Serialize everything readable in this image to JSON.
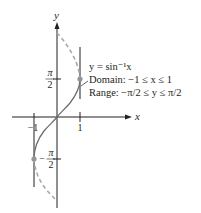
{
  "figure": {
    "function_label": "y = sin⁻¹x",
    "domain_label": "Domain:  −1 ≤ x ≤ 1",
    "range_label": "Range: −π/2 ≤ y ≤ π/2",
    "axes": {
      "x_label": "x",
      "y_label": "y",
      "x_ticks": [
        "−1",
        "1"
      ],
      "y_ticks": {
        "top_num": "π",
        "top_den": "2",
        "bottom_num": "π",
        "bottom_den": "2",
        "bottom_sign": "−"
      }
    },
    "colors": {
      "curve": "#6d6e71",
      "dashed": "#a7a9ac",
      "axes": "#231f20",
      "points": "#939598"
    }
  }
}
